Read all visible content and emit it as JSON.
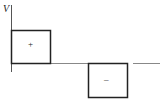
{
  "diagram": {
    "y_axis_label": "V",
    "positive_pulse_label": "+",
    "negative_pulse_label": "–",
    "colors": {
      "line": "#222222",
      "axis": "#555555"
    }
  }
}
